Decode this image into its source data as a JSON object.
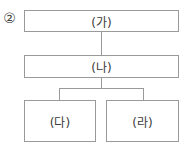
{
  "option_number": "②",
  "diagram": {
    "nodes": [
      {
        "id": "ga",
        "label": "(가)",
        "level": 1
      },
      {
        "id": "na",
        "label": "(나)",
        "level": 2
      },
      {
        "id": "da",
        "label": "(다)",
        "level": 3
      },
      {
        "id": "ra",
        "label": "(라)",
        "level": 3
      }
    ],
    "edges": [
      {
        "from": "ga",
        "to": "na"
      },
      {
        "from": "na",
        "to": "da"
      },
      {
        "from": "na",
        "to": "ra"
      }
    ],
    "colors": {
      "border": "#9a9a9a",
      "text": "#3a3a3a",
      "background": "#ffffff"
    }
  }
}
